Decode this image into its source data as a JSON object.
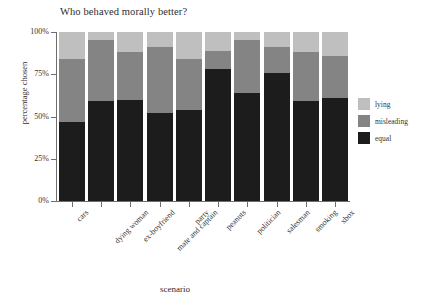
{
  "chart_data": {
    "type": "bar",
    "stacked": true,
    "stack_mode": "percent",
    "title": "Who behaved morally better?",
    "xlabel": "scenario",
    "ylabel": "percentage chosen",
    "ylim": [
      0,
      100
    ],
    "ytick_labels": [
      "0%",
      "25%",
      "50%",
      "75%",
      "100%"
    ],
    "ytick_values": [
      0,
      25,
      50,
      75,
      100
    ],
    "grid": false,
    "legend_position": "right",
    "categories": [
      "cars",
      "dying woman",
      "ex-boyfriend",
      "mate and captain",
      "party",
      "peanuts",
      "politician",
      "salesman",
      "smoking",
      "xbox"
    ],
    "series": [
      {
        "name": "equal",
        "color": "#1c1c1c",
        "values": [
          47,
          59,
          60,
          52,
          54,
          78,
          64,
          76,
          59,
          61
        ]
      },
      {
        "name": "misleading",
        "color": "#848484",
        "values": [
          37,
          36,
          28,
          39,
          30,
          11,
          31,
          15,
          29,
          25
        ]
      },
      {
        "name": "lying",
        "color": "#bfbfbf",
        "values": [
          16,
          5,
          12,
          9,
          16,
          11,
          5,
          9,
          12,
          14
        ]
      }
    ],
    "cumulative_tops": {
      "equal": [
        47,
        59,
        60,
        52,
        54,
        78,
        64,
        76,
        59,
        61
      ],
      "misleading": [
        84,
        95,
        88,
        91,
        84,
        89,
        95,
        91,
        88,
        86
      ],
      "lying": [
        100,
        100,
        100,
        100,
        100,
        100,
        100,
        100,
        100,
        100
      ]
    }
  },
  "legend": {
    "entries": [
      {
        "label": "lying",
        "color": "#bfbfbf"
      },
      {
        "label": "misleading",
        "color": "#848484"
      },
      {
        "label": "equal",
        "color": "#1c1c1c"
      }
    ]
  }
}
